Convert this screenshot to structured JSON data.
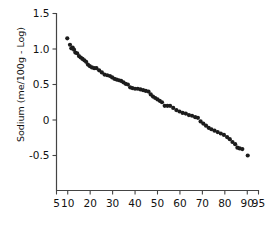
{
  "chart_data": {
    "type": "scatter",
    "title": "",
    "subtitle": "",
    "xlabel": "",
    "ylabel": "Sodium (me/100g - Log)",
    "xlim": [
      5,
      95
    ],
    "ylim": [
      -0.85,
      1.5
    ],
    "xticks": [
      5,
      10,
      20,
      30,
      40,
      50,
      60,
      70,
      80,
      90,
      95
    ],
    "xtick_labels": [
      "5",
      "10",
      "20",
      "30",
      "40",
      "50",
      "60",
      "70",
      "80",
      "90",
      "95"
    ],
    "yticks": [
      1.5,
      1.0,
      0.5,
      0,
      -0.5
    ],
    "ytick_labels": [
      "1.5",
      "1.0",
      "0.5",
      "0",
      "-0.5"
    ],
    "grid": false,
    "legend": null,
    "marker": "circle",
    "marker_color": "#1c1c1c",
    "marker_size": 2.1,
    "series": [
      {
        "name": "Sodium",
        "points": [
          [
            9.8,
            1.15
          ],
          [
            11.0,
            1.06
          ],
          [
            11.6,
            1.01
          ],
          [
            12.2,
            1.02
          ],
          [
            12.8,
            0.99
          ],
          [
            13.4,
            0.95
          ],
          [
            14.2,
            0.94
          ],
          [
            15.0,
            0.9
          ],
          [
            15.8,
            0.88
          ],
          [
            16.6,
            0.86
          ],
          [
            17.4,
            0.84
          ],
          [
            18.2,
            0.82
          ],
          [
            19.0,
            0.78
          ],
          [
            19.8,
            0.76
          ],
          [
            20.8,
            0.74
          ],
          [
            21.8,
            0.73
          ],
          [
            22.8,
            0.73
          ],
          [
            24.0,
            0.7
          ],
          [
            25.2,
            0.67
          ],
          [
            26.4,
            0.64
          ],
          [
            27.6,
            0.63
          ],
          [
            28.8,
            0.62
          ],
          [
            29.8,
            0.6
          ],
          [
            30.8,
            0.58
          ],
          [
            31.8,
            0.57
          ],
          [
            32.8,
            0.56
          ],
          [
            33.8,
            0.55
          ],
          [
            34.8,
            0.53
          ],
          [
            35.8,
            0.51
          ],
          [
            36.8,
            0.5
          ],
          [
            37.8,
            0.46
          ],
          [
            38.8,
            0.45
          ],
          [
            40.0,
            0.44
          ],
          [
            41.2,
            0.44
          ],
          [
            42.4,
            0.43
          ],
          [
            43.6,
            0.42
          ],
          [
            44.8,
            0.41
          ],
          [
            46.0,
            0.4
          ],
          [
            47.0,
            0.36
          ],
          [
            48.0,
            0.33
          ],
          [
            49.0,
            0.31
          ],
          [
            50.0,
            0.29
          ],
          [
            51.0,
            0.27
          ],
          [
            52.0,
            0.25
          ],
          [
            53.2,
            0.2
          ],
          [
            54.4,
            0.2
          ],
          [
            55.6,
            0.2
          ],
          [
            57.0,
            0.17
          ],
          [
            58.4,
            0.14
          ],
          [
            59.8,
            0.12
          ],
          [
            61.2,
            0.1
          ],
          [
            62.6,
            0.09
          ],
          [
            64.0,
            0.07
          ],
          [
            65.4,
            0.06
          ],
          [
            66.8,
            0.04
          ],
          [
            68.0,
            0.03
          ],
          [
            69.2,
            -0.02
          ],
          [
            70.4,
            -0.05
          ],
          [
            71.6,
            -0.08
          ],
          [
            72.8,
            -0.11
          ],
          [
            74.0,
            -0.13
          ],
          [
            75.4,
            -0.15
          ],
          [
            76.8,
            -0.17
          ],
          [
            78.2,
            -0.19
          ],
          [
            79.6,
            -0.21
          ],
          [
            81.0,
            -0.24
          ],
          [
            82.2,
            -0.27
          ],
          [
            83.4,
            -0.31
          ],
          [
            84.6,
            -0.34
          ],
          [
            85.6,
            -0.39
          ],
          [
            86.6,
            -0.4
          ],
          [
            87.8,
            -0.41
          ],
          [
            90.2,
            -0.5
          ]
        ]
      }
    ]
  }
}
